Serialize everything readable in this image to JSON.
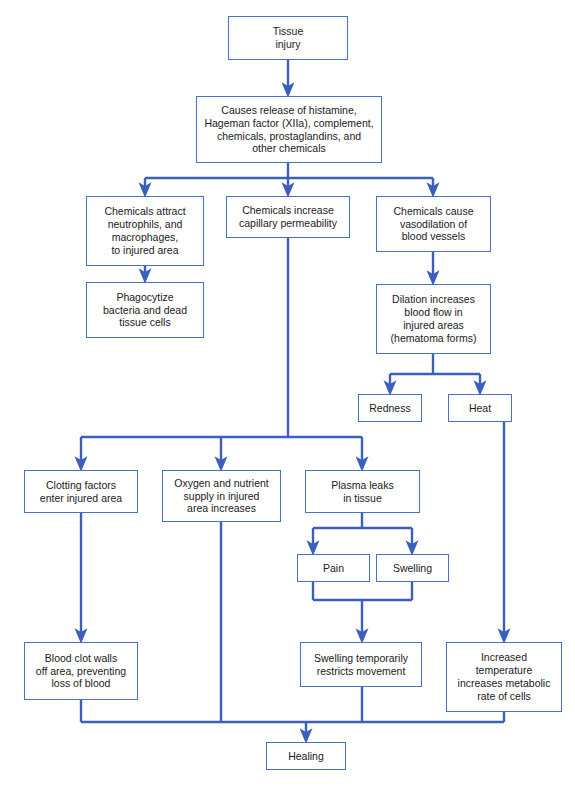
{
  "diagram": {
    "colors": {
      "box_border": "#4472c4",
      "connector": "#3b5fbf",
      "text": "#1a1a1a",
      "background": "#ffffff"
    },
    "nodes": [
      {
        "id": "tissue-injury",
        "label": "Tissue\ninjury",
        "x": 228,
        "y": 16,
        "w": 120,
        "h": 44
      },
      {
        "id": "causes-release",
        "label": "Causes release of histamine,\nHageman factor (XIIa), complement,\nchemicals, prostaglandins, and\nother chemicals",
        "x": 196,
        "y": 96,
        "w": 186,
        "h": 67
      },
      {
        "id": "chemicals-attract",
        "label": "Chemicals attract\nneutrophils, and\nmacrophages,\nto injured area",
        "x": 86,
        "y": 196,
        "w": 118,
        "h": 70
      },
      {
        "id": "chemicals-increase",
        "label": "Chemicals increase\ncapillary permeability",
        "x": 226,
        "y": 196,
        "w": 124,
        "h": 42
      },
      {
        "id": "chemicals-vasodilation",
        "label": "Chemicals cause\nvasodilation of\nblood vessels",
        "x": 376,
        "y": 196,
        "w": 115,
        "h": 56
      },
      {
        "id": "phagocytize",
        "label": "Phagocytize\nbacteria and dead\ntissue cells",
        "x": 86,
        "y": 282,
        "w": 118,
        "h": 56
      },
      {
        "id": "dilation-increases",
        "label": "Dilation increases\nblood flow in\ninjured areas\n(hematoma forms)",
        "x": 376,
        "y": 284,
        "w": 115,
        "h": 70
      },
      {
        "id": "redness",
        "label": "Redness",
        "x": 358,
        "y": 394,
        "w": 64,
        "h": 28
      },
      {
        "id": "heat",
        "label": "Heat",
        "x": 448,
        "y": 394,
        "w": 64,
        "h": 28
      },
      {
        "id": "clotting-factors",
        "label": "Clotting factors\nenter injured area",
        "x": 24,
        "y": 470,
        "w": 114,
        "h": 43
      },
      {
        "id": "oxygen-nutrient",
        "label": "Oxygen and nutrient\nsupply in injured\narea increases",
        "x": 162,
        "y": 470,
        "w": 119,
        "h": 52
      },
      {
        "id": "plasma-leaks",
        "label": "Plasma leaks\nin tissue",
        "x": 305,
        "y": 470,
        "w": 115,
        "h": 43
      },
      {
        "id": "pain",
        "label": "Pain",
        "x": 297,
        "y": 554,
        "w": 73,
        "h": 28
      },
      {
        "id": "swelling",
        "label": "Swelling",
        "x": 376,
        "y": 554,
        "w": 73,
        "h": 28
      },
      {
        "id": "blood-clot-walls",
        "label": "Blood clot walls\noff area, preventing\nloss of blood",
        "x": 24,
        "y": 642,
        "w": 114,
        "h": 58
      },
      {
        "id": "swelling-restricts",
        "label": "Swelling temporarily\nrestricts movement",
        "x": 300,
        "y": 642,
        "w": 122,
        "h": 45
      },
      {
        "id": "increased-temperature",
        "label": "Increased\ntemperature\nincreases metabolic\nrate of cells",
        "x": 446,
        "y": 642,
        "w": 116,
        "h": 70
      },
      {
        "id": "healing",
        "label": "Healing",
        "x": 266,
        "y": 742,
        "w": 80,
        "h": 28
      }
    ],
    "edges": [
      {
        "id": "edge-tissue-to-causes",
        "from": "tissue-injury",
        "to": "causes-release"
      },
      {
        "id": "edge-causes-to-attract",
        "from": "causes-release",
        "to": "chemicals-attract"
      },
      {
        "id": "edge-causes-to-increase",
        "from": "causes-release",
        "to": "chemicals-increase"
      },
      {
        "id": "edge-causes-to-vasodilation",
        "from": "causes-release",
        "to": "chemicals-vasodilation"
      },
      {
        "id": "edge-attract-to-phagocytize",
        "from": "chemicals-attract",
        "to": "phagocytize"
      },
      {
        "id": "edge-vasodilation-to-dilation",
        "from": "chemicals-vasodilation",
        "to": "dilation-increases"
      },
      {
        "id": "edge-dilation-to-redness",
        "from": "dilation-increases",
        "to": "redness"
      },
      {
        "id": "edge-dilation-to-heat",
        "from": "dilation-increases",
        "to": "heat"
      },
      {
        "id": "edge-increase-to-clotting",
        "from": "chemicals-increase",
        "to": "clotting-factors"
      },
      {
        "id": "edge-increase-to-oxygen",
        "from": "chemicals-increase",
        "to": "oxygen-nutrient"
      },
      {
        "id": "edge-increase-to-plasma",
        "from": "chemicals-increase",
        "to": "plasma-leaks"
      },
      {
        "id": "edge-plasma-to-pain",
        "from": "plasma-leaks",
        "to": "pain"
      },
      {
        "id": "edge-plasma-to-swelling",
        "from": "plasma-leaks",
        "to": "swelling"
      },
      {
        "id": "edge-clotting-to-bloodclot",
        "from": "clotting-factors",
        "to": "blood-clot-walls"
      },
      {
        "id": "edge-painswelling-to-restricts",
        "from": "pain,swelling",
        "to": "swelling-restricts"
      },
      {
        "id": "edge-heat-to-temperature",
        "from": "heat",
        "to": "increased-temperature"
      },
      {
        "id": "edge-bloodclot-to-healing",
        "from": "blood-clot-walls",
        "to": "healing"
      },
      {
        "id": "edge-oxygen-to-healing",
        "from": "oxygen-nutrient",
        "to": "healing"
      },
      {
        "id": "edge-restricts-to-healing",
        "from": "swelling-restricts",
        "to": "healing"
      },
      {
        "id": "edge-temperature-to-healing",
        "from": "increased-temperature",
        "to": "healing"
      }
    ]
  }
}
